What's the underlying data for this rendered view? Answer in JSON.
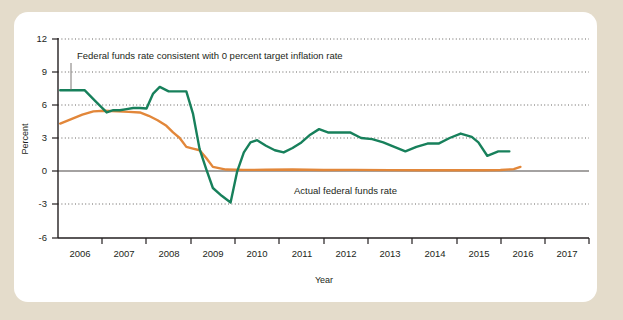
{
  "figure": {
    "background_color": "#e4dccb",
    "card_color": "#ffffff"
  },
  "chart_data": {
    "type": "line",
    "title": "",
    "subtitle": "",
    "xlabel": "Year",
    "ylabel": "Percent",
    "xlim": [
      2005.5,
      2017.5
    ],
    "ylim": [
      -6,
      12
    ],
    "yticks": [
      12,
      9,
      6,
      3,
      0,
      -3,
      -6
    ],
    "ytick_labels": [
      "12",
      "9",
      "6",
      "3",
      "0",
      "-3",
      "-6"
    ],
    "xticks": [
      2006,
      2007,
      2008,
      2009,
      2010,
      2011,
      2012,
      2013,
      2014,
      2015,
      2016,
      2017
    ],
    "xtick_labels": [
      "2006",
      "2007",
      "2008",
      "2009",
      "2010",
      "2011",
      "2012",
      "2013",
      "2014",
      "2015",
      "2016",
      "2017"
    ],
    "grid": "horizontal-dotted",
    "legend": "inline-annotations",
    "zero_line": 0,
    "colors": {
      "taylor_rule": "#17805b",
      "actual_rate": "#e2873a",
      "axis": "#231f20",
      "grid": "#55524f"
    },
    "series": [
      {
        "name": "Federal funds rate consistent with 0 percent target inflation rate",
        "key": "taylor_rule",
        "color": "#17805b",
        "x": [
          2005.55,
          2005.85,
          2006.1,
          2006.35,
          2006.6,
          2006.75,
          2006.9,
          2007.05,
          2007.2,
          2007.35,
          2007.5,
          2007.65,
          2007.8,
          2008.0,
          2008.2,
          2008.4,
          2008.55,
          2008.7,
          2008.85,
          2009.0,
          2009.2,
          2009.4,
          2009.55,
          2009.7,
          2009.85,
          2010.0,
          2010.2,
          2010.4,
          2010.6,
          2010.8,
          2011.0,
          2011.2,
          2011.4,
          2011.6,
          2011.85,
          2012.1,
          2012.35,
          2012.6,
          2012.85,
          2013.1,
          2013.35,
          2013.6,
          2013.85,
          2014.1,
          2014.35,
          2014.6,
          2014.85,
          2015.0,
          2015.2,
          2015.45,
          2015.7
        ],
        "y": [
          7.3,
          7.3,
          7.3,
          6.3,
          5.3,
          5.5,
          5.5,
          5.6,
          5.7,
          5.7,
          5.65,
          7.0,
          7.6,
          7.2,
          7.2,
          7.2,
          5.2,
          2.0,
          0.2,
          -1.5,
          -2.2,
          -2.8,
          0.0,
          1.7,
          2.6,
          2.8,
          2.3,
          1.9,
          1.7,
          2.1,
          2.6,
          3.3,
          3.8,
          3.5,
          3.5,
          3.5,
          3.0,
          2.9,
          2.6,
          2.2,
          1.8,
          2.2,
          2.5,
          2.5,
          3.0,
          3.4,
          3.1,
          2.6,
          1.4,
          1.8,
          1.8
        ]
      },
      {
        "name": "Actual federal funds rate",
        "key": "actual_rate",
        "color": "#e2873a",
        "x": [
          2005.55,
          2005.8,
          2006.05,
          2006.3,
          2006.55,
          2006.85,
          2007.1,
          2007.35,
          2007.55,
          2007.75,
          2007.95,
          2008.1,
          2008.25,
          2008.4,
          2008.55,
          2008.7,
          2008.85,
          2009.0,
          2009.3,
          2009.7,
          2010.2,
          2010.8,
          2011.5,
          2012.2,
          2013.0,
          2013.8,
          2014.5,
          2015.1,
          2015.5,
          2015.8,
          2015.95
        ],
        "y": [
          4.3,
          4.7,
          5.1,
          5.4,
          5.45,
          5.4,
          5.35,
          5.3,
          5.0,
          4.6,
          4.1,
          3.5,
          3.0,
          2.2,
          2.05,
          1.9,
          1.2,
          0.4,
          0.16,
          0.13,
          0.14,
          0.16,
          0.12,
          0.13,
          0.11,
          0.1,
          0.1,
          0.1,
          0.12,
          0.2,
          0.4
        ]
      }
    ],
    "annotations": [
      {
        "key": "taylor_label",
        "text": "Federal funds rate consistent with 0 percent target inflation rate",
        "x_px": 69,
        "y_px": 57,
        "leader": {
          "x1": 71,
          "y1": 61,
          "x2": 71,
          "y2": 88
        }
      },
      {
        "key": "actual_label",
        "text": "Actual federal funds rate",
        "x_px": 293,
        "y_px": 190
      }
    ]
  }
}
